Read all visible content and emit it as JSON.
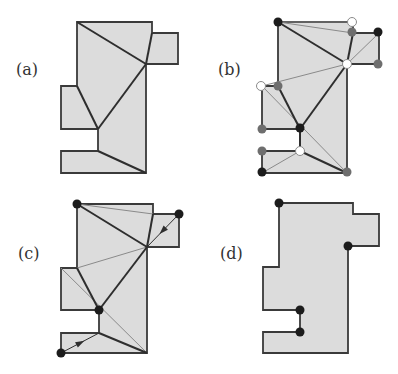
{
  "figure": {
    "colors": {
      "fill": "#dcdcdc",
      "outline": "#3a3a3a",
      "thick_edge": "#2e2e2e",
      "thin_edge": "#8a8a8a",
      "dot_black": "#1c1c1c",
      "dot_grey": "#6e6e6e",
      "dot_white": "#ffffff"
    },
    "panels": [
      {
        "id": "a",
        "label": "(a)",
        "label_pos": [
          16,
          75
        ],
        "polygon": [
          [
            77,
            22
          ],
          [
            152,
            22
          ],
          [
            152,
            33
          ],
          [
            178,
            33
          ],
          [
            178,
            64
          ],
          [
            146,
            64
          ],
          [
            146,
            173
          ],
          [
            61,
            173
          ],
          [
            61,
            151
          ],
          [
            98,
            151
          ],
          [
            98,
            129
          ],
          [
            61,
            129
          ],
          [
            61,
            86
          ],
          [
            77,
            86
          ]
        ],
        "thick_edges": [
          [
            [
              77,
              22
            ],
            [
              146,
              64
            ]
          ],
          [
            [
              152,
              33
            ],
            [
              146,
              64
            ]
          ],
          [
            [
              146,
              64
            ],
            [
              98,
              129
            ]
          ],
          [
            [
              98,
              129
            ],
            [
              77,
              86
            ]
          ],
          [
            [
              98,
              151
            ],
            [
              146,
              173
            ]
          ]
        ],
        "thin_edges": [],
        "dots": []
      },
      {
        "id": "b",
        "label": "(b)",
        "label_pos": [
          218,
          75
        ],
        "polygon": [
          [
            278,
            22
          ],
          [
            353,
            22
          ],
          [
            353,
            33
          ],
          [
            379,
            33
          ],
          [
            379,
            64
          ],
          [
            347,
            64
          ],
          [
            347,
            173
          ],
          [
            262,
            173
          ],
          [
            262,
            151
          ],
          [
            300,
            151
          ],
          [
            300,
            129
          ],
          [
            262,
            129
          ],
          [
            262,
            86
          ],
          [
            278,
            86
          ]
        ],
        "thick_edges": [
          [
            [
              278,
              22
            ],
            [
              347,
              64
            ]
          ],
          [
            [
              353,
              33
            ],
            [
              347,
              64
            ]
          ],
          [
            [
              347,
              64
            ],
            [
              300,
              129
            ]
          ],
          [
            [
              300,
              129
            ],
            [
              278,
              86
            ]
          ],
          [
            [
              300,
              129
            ],
            [
              300,
              151
            ]
          ],
          [
            [
              300,
              151
            ],
            [
              347,
              173
            ]
          ]
        ],
        "thin_edges": [
          [
            [
              278,
              22
            ],
            [
              353,
              22
            ]
          ],
          [
            [
              278,
              22
            ],
            [
              353,
              33
            ]
          ],
          [
            [
              347,
              64
            ],
            [
              379,
              33
            ]
          ],
          [
            [
              347,
              64
            ],
            [
              262,
              86
            ]
          ],
          [
            [
              262,
              86
            ],
            [
              347,
              173
            ]
          ],
          [
            [
              262,
              173
            ],
            [
              300,
              151
            ]
          ]
        ],
        "dots": [
          {
            "pos": [
              278,
              22
            ],
            "kind": "black"
          },
          {
            "pos": [
              352,
              22
            ],
            "kind": "white"
          },
          {
            "pos": [
              352,
              32
            ],
            "kind": "grey"
          },
          {
            "pos": [
              378,
              32
            ],
            "kind": "black"
          },
          {
            "pos": [
              378,
              64
            ],
            "kind": "grey"
          },
          {
            "pos": [
              347,
              64
            ],
            "kind": "white"
          },
          {
            "pos": [
              261,
              86
            ],
            "kind": "white"
          },
          {
            "pos": [
              278,
              86
            ],
            "kind": "grey"
          },
          {
            "pos": [
              262,
              129
            ],
            "kind": "grey"
          },
          {
            "pos": [
              300,
              128
            ],
            "kind": "black"
          },
          {
            "pos": [
              262,
              151
            ],
            "kind": "grey"
          },
          {
            "pos": [
              300,
              151
            ],
            "kind": "white"
          },
          {
            "pos": [
              262,
              172
            ],
            "kind": "black"
          },
          {
            "pos": [
              347,
              172
            ],
            "kind": "grey"
          }
        ]
      },
      {
        "id": "c",
        "label": "(c)",
        "label_pos": [
          18,
          259
        ],
        "polygon": [
          [
            77,
            204
          ],
          [
            153,
            204
          ],
          [
            153,
            214
          ],
          [
            179,
            214
          ],
          [
            179,
            247
          ],
          [
            147,
            247
          ],
          [
            147,
            353
          ],
          [
            61,
            353
          ],
          [
            61,
            333
          ],
          [
            99,
            333
          ],
          [
            99,
            310
          ],
          [
            61,
            310
          ],
          [
            61,
            268
          ],
          [
            77,
            268
          ]
        ],
        "thick_edges": [
          [
            [
              77,
              204
            ],
            [
              147,
              247
            ]
          ],
          [
            [
              153,
              214
            ],
            [
              147,
              247
            ]
          ],
          [
            [
              147,
              247
            ],
            [
              99,
              310
            ]
          ],
          [
            [
              99,
              310
            ],
            [
              77,
              268
            ]
          ],
          [
            [
              99,
              333
            ],
            [
              147,
              353
            ]
          ]
        ],
        "thin_edges": [
          [
            [
              77,
              204
            ],
            [
              153,
              214
            ]
          ],
          [
            [
              147,
              247
            ],
            [
              77,
              268
            ]
          ],
          [
            [
              61,
              268
            ],
            [
              147,
              353
            ]
          ]
        ],
        "arrows": [
          {
            "from": [
              179,
              214
            ],
            "to": [
              147,
              247
            ]
          },
          {
            "from": [
              61,
              353
            ],
            "to": [
              99,
              333
            ]
          }
        ],
        "dots": [
          {
            "pos": [
              77,
              204
            ],
            "kind": "black"
          },
          {
            "pos": [
              179,
              214
            ],
            "kind": "black"
          },
          {
            "pos": [
              99,
              310
            ],
            "kind": "black"
          },
          {
            "pos": [
              61,
              353
            ],
            "kind": "black"
          }
        ]
      },
      {
        "id": "d",
        "label": "(d)",
        "label_pos": [
          220,
          259
        ],
        "polygon": [
          [
            279,
            203
          ],
          [
            353,
            203
          ],
          [
            353,
            214
          ],
          [
            379,
            214
          ],
          [
            379,
            246
          ],
          [
            348,
            246
          ],
          [
            348,
            353
          ],
          [
            263,
            353
          ],
          [
            263,
            332
          ],
          [
            300,
            332
          ],
          [
            300,
            310
          ],
          [
            263,
            310
          ],
          [
            263,
            267
          ],
          [
            279,
            267
          ]
        ],
        "thick_edges": [],
        "thin_edges": [],
        "dots": [
          {
            "pos": [
              279,
              203
            ],
            "kind": "black"
          },
          {
            "pos": [
              348,
              246
            ],
            "kind": "black"
          },
          {
            "pos": [
              300,
              310
            ],
            "kind": "black"
          },
          {
            "pos": [
              300,
              332
            ],
            "kind": "black"
          }
        ]
      }
    ]
  }
}
